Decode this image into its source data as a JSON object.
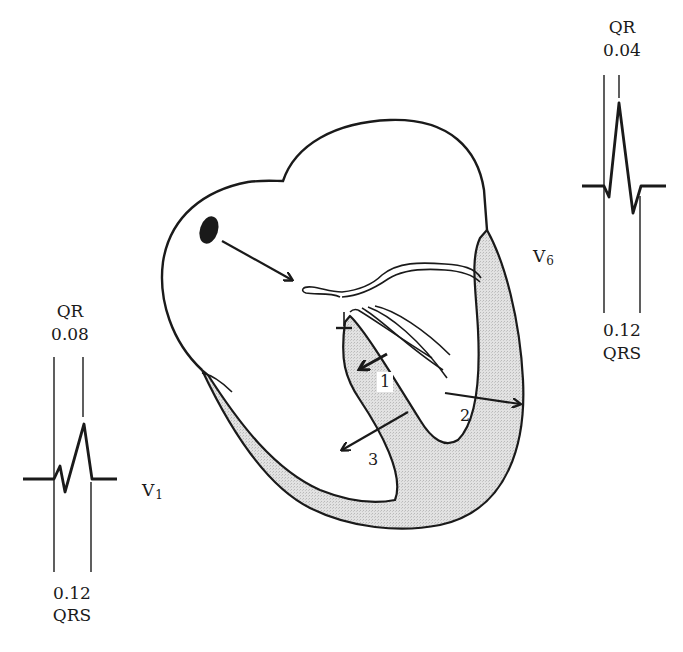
{
  "diagram": {
    "type": "heart-conduction-ecg",
    "colors": {
      "stroke": "#1a1a1a",
      "myocardium_fill": "#dcdcdc",
      "background": "#ffffff"
    }
  },
  "lead_v1": {
    "name": "V",
    "subscript": "1",
    "top_label": "QR",
    "top_value": "0.08",
    "bottom_value": "0.12",
    "bottom_label": "QRS"
  },
  "lead_v6": {
    "name": "V",
    "subscript": "6",
    "top_label": "QR",
    "top_value": "0.04",
    "bottom_value": "0.12",
    "bottom_label": "QRS"
  },
  "vectors": [
    {
      "id": "1",
      "label": "1"
    },
    {
      "id": "2",
      "label": "2"
    },
    {
      "id": "3",
      "label": "3"
    }
  ]
}
